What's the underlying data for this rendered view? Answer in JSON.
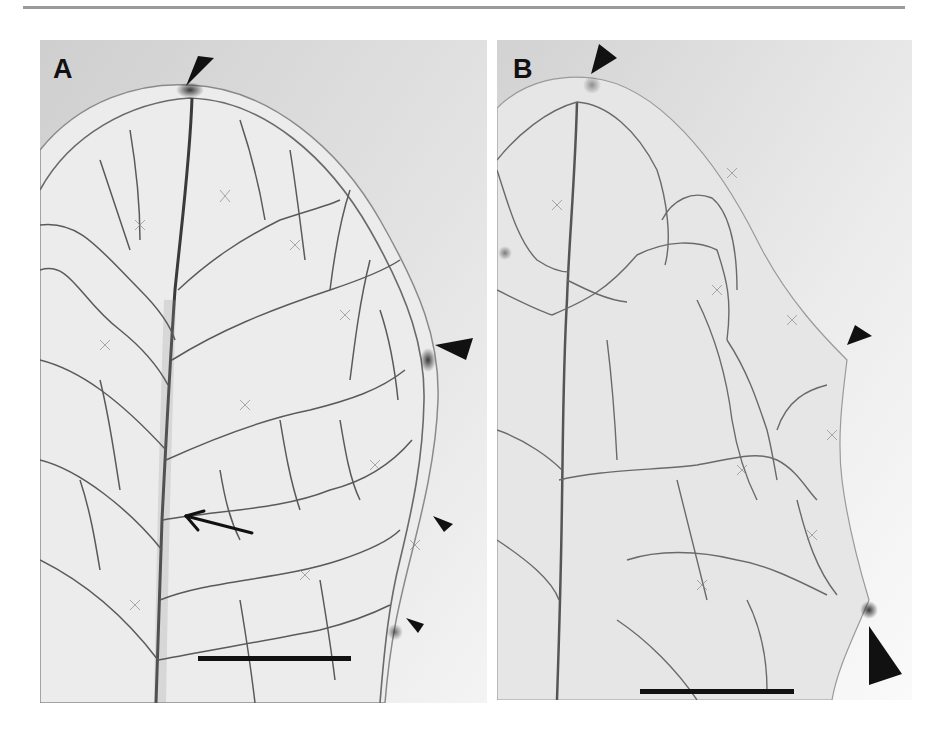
{
  "figure": {
    "panels": [
      {
        "label": "A",
        "annotations": {
          "arrowheads": 4,
          "arrows": 1,
          "scale_bar": true
        }
      },
      {
        "label": "B",
        "annotations": {
          "arrowheads": 3,
          "arrows": 0,
          "scale_bar": true
        }
      }
    ],
    "colors": {
      "background_outside_leaf": "#d6d6d6",
      "leaf_tissue": "#e6e6e6",
      "vein": "#555555",
      "annotation": "#111111",
      "rule": "#9a9a9a"
    }
  }
}
